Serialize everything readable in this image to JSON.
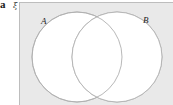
{
  "figure": {
    "part_label": "a",
    "universal_set_symbol": "ξ",
    "box_fill_color": "#e9e9e9",
    "box_border_color": "#bdbdbd",
    "circle_fill_color": "#ffffff",
    "circle_stroke_color": "#b0b0b0",
    "labels": {
      "set_a": "A",
      "set_b": "B"
    }
  },
  "diagram_data": {
    "type": "venn",
    "sets": [
      "A",
      "B"
    ],
    "relationship": "overlapping",
    "regions": [
      "A only",
      "A and B",
      "B only",
      "neither (universal set)"
    ],
    "shaded_regions": [],
    "universal_set": "ξ"
  }
}
